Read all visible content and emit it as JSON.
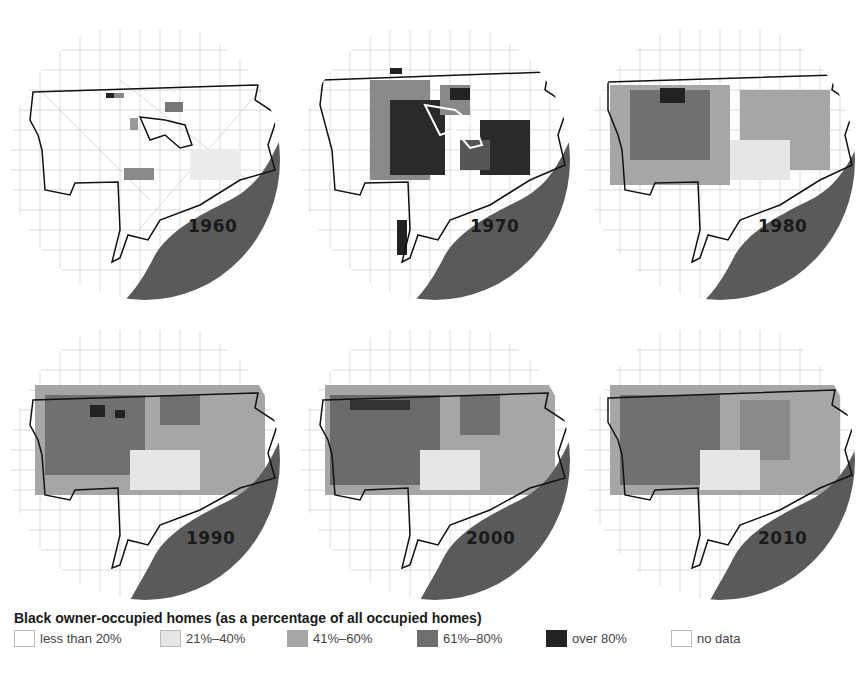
{
  "legend": {
    "title": "Black owner-occupied homes (as a percentage of all occupied homes)",
    "items": [
      {
        "label": "less than 20%",
        "color": "#ffffff"
      },
      {
        "label": "21%–40%",
        "color": "#e6e6e6"
      },
      {
        "label": "41%–60%",
        "color": "#a6a6a6"
      },
      {
        "label": "61%–80%",
        "color": "#6e6e6e"
      },
      {
        "label": "over 80%",
        "color": "#222222"
      },
      {
        "label": "no data",
        "color": "#ffffff"
      }
    ]
  },
  "maps": [
    {
      "year": "1960"
    },
    {
      "year": "1970"
    },
    {
      "year": "1980"
    },
    {
      "year": "1990"
    },
    {
      "year": "2000"
    },
    {
      "year": "2010"
    }
  ],
  "colors": {
    "river": "#5a5a5a",
    "boundary": "#111111",
    "streets": "#cfcfcf"
  }
}
